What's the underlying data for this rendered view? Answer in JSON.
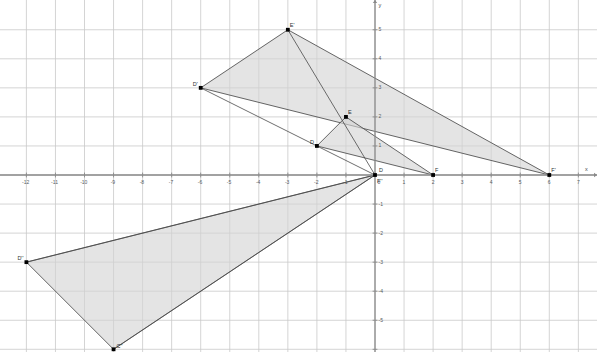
{
  "figure": {
    "title": "",
    "background_color": "#ffffff",
    "grid_color": "#c9c9c9",
    "axis_color": "#8a8a8a",
    "shape_stroke_color": "#4a4a4a",
    "shape_fill_color": "#d4d4d4",
    "point_color": "#000000",
    "label_color": "#555a5e"
  },
  "axes": {
    "x_label": "x",
    "y_label": "y",
    "origin_label": "0",
    "x_min": -13.45,
    "x_max": 7.65,
    "y_min": -6.1,
    "y_max": 5.55,
    "x_ticks": [
      -13,
      -12,
      -11,
      -10,
      -9,
      -8,
      -7,
      -6,
      -5,
      -4,
      -3,
      -2,
      -1,
      1,
      2,
      3,
      4,
      5,
      6,
      7
    ],
    "x_tick_labels": [
      "-13",
      "-12",
      "-11",
      "-10",
      "-9",
      "-8",
      "-7",
      "-6",
      "-5",
      "-4",
      "-3",
      "-2",
      "-1",
      "1",
      "2",
      "3",
      "4",
      "5",
      "6",
      "7"
    ],
    "y_ticks": [
      5,
      4,
      3,
      2,
      1,
      -1,
      -2,
      -3,
      -4,
      -5,
      -6
    ],
    "y_tick_labels": [
      "5",
      "4",
      "3",
      "2",
      "1",
      "-1",
      "-2",
      "-3",
      "-4",
      "-5",
      "-6"
    ],
    "grid": true,
    "pixels_per_unit": 29.05,
    "origin_px": {
      "x": 375.0,
      "y": 175.0
    }
  },
  "chart_data": {
    "type": "scatter",
    "title": "",
    "xlabel": "x",
    "ylabel": "y",
    "xlim": [
      -13.45,
      7.65
    ],
    "ylim": [
      -6.1,
      5.55
    ],
    "grid": true,
    "legend": "none",
    "shapes": [
      {
        "name": "triangle-DEF",
        "kind": "triangle",
        "filled": true,
        "vertices": [
          {
            "label": "D",
            "x": -2,
            "y": 1
          },
          {
            "label": "E",
            "x": -1,
            "y": 2
          },
          {
            "label": "F",
            "x": 2,
            "y": 0
          }
        ]
      },
      {
        "name": "triangle-DEF-prime",
        "kind": "triangle",
        "filled": true,
        "vertices": [
          {
            "label": "D'",
            "x": -6,
            "y": 3
          },
          {
            "label": "E'",
            "x": -3,
            "y": 5
          },
          {
            "label": "F'",
            "x": 6,
            "y": 0
          }
        ]
      },
      {
        "name": "triangle-DEF-double-prime",
        "kind": "triangle",
        "filled": true,
        "vertices": [
          {
            "label": "D''",
            "x": -12,
            "y": -3
          },
          {
            "label": "C''",
            "x": -9,
            "y": -6
          },
          {
            "label": "F''",
            "x": 0,
            "y": 0
          }
        ]
      }
    ],
    "rays": [
      {
        "name": "ray-origin-to-Dprime",
        "from": {
          "x": 0,
          "y": 0
        },
        "to": {
          "x": -6,
          "y": 3
        }
      },
      {
        "name": "ray-origin-to-Eprime",
        "from": {
          "x": 0,
          "y": 0
        },
        "to": {
          "x": -3,
          "y": 5
        }
      },
      {
        "name": "ray-origin-to-Ddouble",
        "from": {
          "x": 0,
          "y": 0
        },
        "to": {
          "x": -12,
          "y": -3
        }
      },
      {
        "name": "ray-origin-to-Cdouble",
        "from": {
          "x": 0,
          "y": 0
        },
        "to": {
          "x": -9,
          "y": -6
        }
      }
    ],
    "points": [
      {
        "label": "D",
        "x": -2,
        "y": 1,
        "label_dx": -7,
        "label_dy": -7
      },
      {
        "label": "E",
        "x": -1,
        "y": 2,
        "label_dx": 2,
        "label_dy": -8
      },
      {
        "label": "F",
        "x": 2,
        "y": 0,
        "label_dx": 2,
        "label_dy": -8
      },
      {
        "label": "D'",
        "x": -6,
        "y": 3,
        "label_dx": -8,
        "label_dy": -7
      },
      {
        "label": "E'",
        "x": -3,
        "y": 5,
        "label_dx": 2,
        "label_dy": -8
      },
      {
        "label": "F'",
        "x": 6,
        "y": 0,
        "label_dx": 2,
        "label_dy": -8
      },
      {
        "label": "D''",
        "x": -12,
        "y": -3,
        "label_dx": -9,
        "label_dy": -7
      },
      {
        "label": "C''",
        "x": -9,
        "y": -6,
        "label_dx": 3,
        "label_dy": -6
      },
      {
        "label": "F''",
        "x": 0,
        "y": 0,
        "label_dx": 2,
        "label_dy": 3
      },
      {
        "label": "D",
        "x": 0,
        "y": 0,
        "label_dx": 4,
        "label_dy": -8
      }
    ]
  }
}
